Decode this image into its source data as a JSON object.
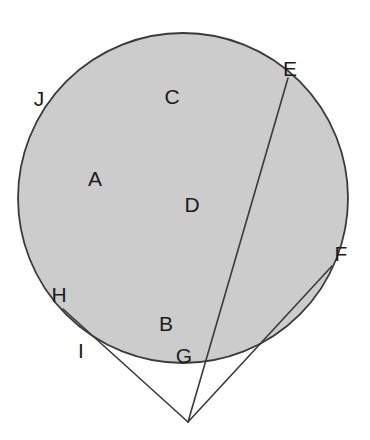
{
  "figure": {
    "background_color": "#ffffff",
    "canvas": {
      "width": 370,
      "height": 440
    }
  },
  "style": {
    "circle_fill": "#cccccc",
    "circle_stroke": "#3a3a3a",
    "circle_stroke_width": 1.8,
    "line_stroke": "#3a3a3a",
    "line_stroke_width": 1.6,
    "label_color": "#1c1c1c",
    "label_font_size": 21
  },
  "shapes": {
    "circle": {
      "name": "main-circle",
      "cx": 183,
      "cy": 198,
      "r": 165
    },
    "external_point": {
      "name": "apex-point",
      "x": 188,
      "y": 422
    },
    "secant_line": {
      "name": "secant-line-E",
      "x1": 288,
      "y1": 78,
      "x2": 188,
      "y2": 422
    },
    "tangent_line_left": {
      "name": "tangent-line-H",
      "x1": 63,
      "y1": 309,
      "x2": 188,
      "y2": 422
    },
    "tangent_line_right": {
      "name": "tangent-line-F",
      "x1": 332,
      "y1": 266,
      "x2": 188,
      "y2": 422
    }
  },
  "labels": [
    {
      "id": "label-A",
      "text": "A",
      "x": 95,
      "y": 180
    },
    {
      "id": "label-B",
      "text": "B",
      "x": 166,
      "y": 325
    },
    {
      "id": "label-C",
      "text": "C",
      "x": 172,
      "y": 98
    },
    {
      "id": "label-D",
      "text": "D",
      "x": 192,
      "y": 206
    },
    {
      "id": "label-E",
      "text": "E",
      "x": 290,
      "y": 70
    },
    {
      "id": "label-F",
      "text": "F",
      "x": 341,
      "y": 255
    },
    {
      "id": "label-G",
      "text": "G",
      "x": 184,
      "y": 357
    },
    {
      "id": "label-H",
      "text": "H",
      "x": 59,
      "y": 296
    },
    {
      "id": "label-I",
      "text": "I",
      "x": 81,
      "y": 352
    },
    {
      "id": "label-J",
      "text": "J",
      "x": 39,
      "y": 100
    }
  ]
}
